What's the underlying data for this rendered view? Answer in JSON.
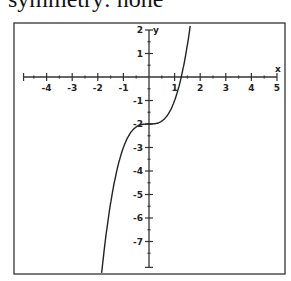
{
  "caption": "symmetry:  none",
  "chart_data": {
    "type": "line",
    "title": "",
    "function": "f(x) = x^3 - 2",
    "xlabel": "x",
    "ylabel": "y",
    "xlim": [
      -5.0,
      5.2
    ],
    "ylim": [
      -8.4,
      2.3
    ],
    "grid": false,
    "x_ticks": [
      -4,
      -3,
      -2,
      -1,
      1,
      2,
      3,
      4,
      5
    ],
    "y_ticks": [
      2,
      1,
      -1,
      -2,
      -3,
      -4,
      -5,
      -6,
      -7
    ],
    "series": [
      {
        "name": "f(x)",
        "x": [
          -1.86,
          -1.6,
          -1.4,
          -1.2,
          -1.0,
          -0.8,
          -0.6,
          -0.4,
          -0.2,
          0,
          0.2,
          0.4,
          0.6,
          0.8,
          1.0,
          1.2,
          1.26,
          1.4,
          1.5,
          1.63
        ],
        "y": [
          -8.43,
          -6.1,
          -4.74,
          -3.73,
          -3.0,
          -2.51,
          -2.22,
          -2.06,
          -2.01,
          -2.0,
          -1.99,
          -1.94,
          -1.78,
          -1.49,
          -1.0,
          -0.27,
          0.0,
          0.74,
          1.38,
          2.33
        ]
      }
    ],
    "key_points": {
      "inflection": [
        0,
        -2
      ],
      "x_intercept": [
        1.26,
        0
      ],
      "y_intercept": [
        0,
        -2
      ]
    }
  },
  "labels": {
    "x_axis": "x",
    "y_axis": "y",
    "xt": [
      "-4",
      "-3",
      "-2",
      "-1",
      "1",
      "2",
      "3",
      "4",
      "5"
    ],
    "yt": [
      "2",
      "1",
      "-1",
      "-2",
      "-3",
      "-4",
      "-5",
      "-6",
      "-7"
    ]
  }
}
